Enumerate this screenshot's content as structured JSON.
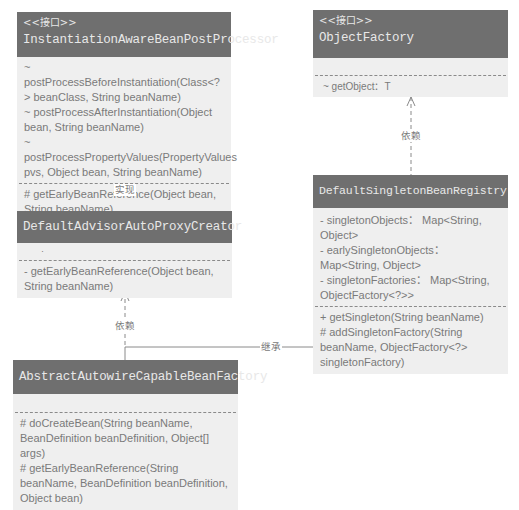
{
  "diagram": {
    "classes": {
      "instantiation_aware": {
        "stereotype": "<<接口>>",
        "name": "InstantiationAwareBeanPostProcessor",
        "attributes": [],
        "methods_1": [
          "~ postProcessBeforeInstantiation(Class<?> beanClass, String beanName)",
          "~ postProcessAfterInstantiation(Object bean, String beanName)",
          "~ postProcessPropertyValues(PropertyValues pvs, Object bean, String beanName)"
        ],
        "methods_2": [
          "# getEarlyBeanReference(Object bean, String beanName)"
        ]
      },
      "object_factory": {
        "stereotype": "<<接口>>",
        "name": "ObjectFactory",
        "attributes": [],
        "methods": [
          "~ getObject：T"
        ]
      },
      "default_advisor": {
        "name": "DefaultAdvisorAutoProxyCreator",
        "attributes": [
          "·"
        ],
        "methods": [
          "- getEarlyBeanReference(Object bean, String beanName)"
        ]
      },
      "default_singleton": {
        "name": "DefaultSingletonBeanRegistry",
        "attributes": [
          "- singletonObjects： Map<String, Object>",
          "- earlySingletonObjects： Map<String, Object>",
          "- singletonFactories： Map<String, ObjectFactory<?>>"
        ],
        "methods": [
          "+ getSingleton(String beanName)",
          "# addSingletonFactory(String beanName, ObjectFactory<?> singletonFactory)"
        ]
      },
      "abstract_autowire": {
        "name": "AbstractAutowireCapableBeanFactory",
        "attributes": [],
        "methods": [
          "# doCreateBean(String beanName, BeanDefinition beanDefinition, Object[] args)",
          "# getEarlyBeanReference(String beanName, BeanDefinition beanDefinition, Object bean)"
        ]
      }
    },
    "relations": {
      "realize_label": "实现",
      "depend_label_1": "依赖",
      "depend_label_2": "依赖",
      "inherit_label": "继承"
    },
    "colors": {
      "header": "#6f6f6f",
      "body": "#efefef",
      "text": "#7a7a7a",
      "line": "#8a8a8a"
    }
  }
}
